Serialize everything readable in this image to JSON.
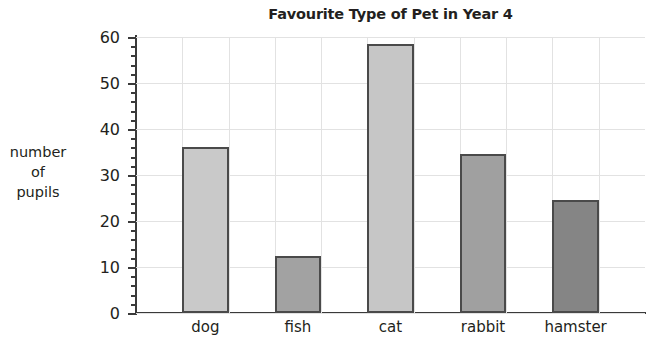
{
  "chart_data": {
    "type": "bar",
    "title": "Favourite Type of Pet in Year 4",
    "xlabel": "",
    "ylabel": "number of pupils",
    "ylabel_lines": [
      "number",
      "of",
      "pupils"
    ],
    "categories": [
      "dog",
      "fish",
      "cat",
      "rabbit",
      "hamster"
    ],
    "values": [
      36,
      12.5,
      58.5,
      34.5,
      24.5
    ],
    "ylim": [
      0,
      60
    ],
    "ytick_labels": [
      "0",
      "10",
      "20",
      "30",
      "40",
      "50",
      "60"
    ],
    "ytick_values": [
      0,
      10,
      20,
      30,
      40,
      50,
      60
    ],
    "yminor_step": 2,
    "grid": true,
    "legend": "none",
    "bar_colors": [
      "#c9c9c9",
      "#a2a2a2",
      "#c6c6c6",
      "#a0a0a0",
      "#858585"
    ],
    "bar_border_color": "#4a4a4a",
    "gridline_color": "#e2e2e2",
    "axis_color": "#3a3a3a",
    "text_color": "#231f20",
    "background": "#ffffff"
  }
}
